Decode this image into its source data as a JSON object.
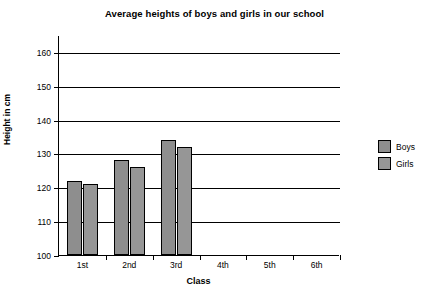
{
  "chart_data": {
    "type": "bar",
    "title": "Average heights of boys and girls in our school",
    "xlabel": "Class",
    "ylabel": "Height in cm",
    "categories": [
      "1st",
      "2nd",
      "3rd",
      "4th",
      "5th",
      "6th"
    ],
    "series": [
      {
        "name": "Boys",
        "values": [
          122,
          128,
          134,
          null,
          null,
          null
        ]
      },
      {
        "name": "Girls",
        "values": [
          121,
          126,
          132,
          null,
          null,
          null
        ]
      }
    ],
    "ylim": [
      100,
      165
    ],
    "yticks": [
      100,
      110,
      120,
      130,
      140,
      150,
      160
    ],
    "ytick_labels": [
      "100",
      "110",
      "120",
      "130",
      "140",
      "150",
      "160"
    ],
    "grid": true,
    "grid_axis": "y",
    "legend_position": "right",
    "colors": {
      "boys": "#8e8e8e",
      "girls": "#969696",
      "outline": "#000000",
      "background": "#ffffff"
    }
  },
  "legend": {
    "items": [
      {
        "label": "Boys",
        "color": "#8e8e8e"
      },
      {
        "label": "Girls",
        "color": "#969696"
      }
    ]
  }
}
